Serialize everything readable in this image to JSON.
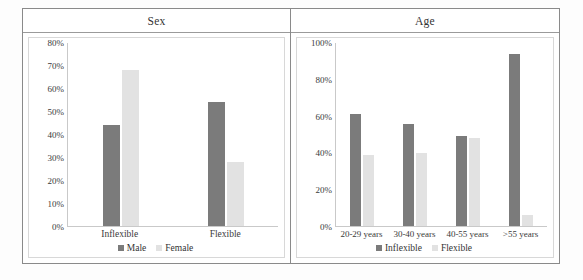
{
  "panels": [
    {
      "title": "Sex",
      "chart_key": 0
    },
    {
      "title": "Age",
      "chart_key": 1
    }
  ],
  "chart_data": [
    {
      "type": "bar",
      "title": "Sex",
      "xlabel": "",
      "ylabel": "",
      "ylim": [
        0,
        80
      ],
      "ytick_labels": [
        "80%",
        "70%",
        "60%",
        "50%",
        "40%",
        "30%",
        "20%",
        "10%",
        "0%"
      ],
      "ytick_values": [
        80,
        70,
        60,
        50,
        40,
        30,
        20,
        10,
        0
      ],
      "grid": false,
      "legend_position": "bottom",
      "categories": [
        "Inflexible",
        "Flexible"
      ],
      "series": [
        {
          "name": "Male",
          "color": "#7b7b7b",
          "values": [
            44,
            54
          ]
        },
        {
          "name": "Female",
          "color": "#e2e2e2",
          "values": [
            68,
            28
          ]
        }
      ]
    },
    {
      "type": "bar",
      "title": "Age",
      "xlabel": "",
      "ylabel": "",
      "ylim": [
        0,
        100
      ],
      "ytick_labels": [
        "100%",
        "80%",
        "60%",
        "40%",
        "20%",
        "0%"
      ],
      "ytick_values": [
        100,
        80,
        60,
        40,
        20,
        0
      ],
      "grid": false,
      "legend_position": "bottom",
      "categories": [
        "20-29 years",
        "30-40 years",
        "40-55 years",
        ">55 years"
      ],
      "series": [
        {
          "name": "Inflexible",
          "color": "#7b7b7b",
          "values": [
            61,
            39,
            56,
            40,
            49,
            48,
            94,
            6
          ]
        }
      ],
      "series_split": [
        {
          "name": "Inflexible",
          "color": "#7b7b7b",
          "values": [
            61,
            56,
            49,
            94
          ]
        },
        {
          "name": "Flexible",
          "color": "#e2e2e2",
          "values": [
            39,
            40,
            48,
            6
          ]
        }
      ]
    }
  ]
}
